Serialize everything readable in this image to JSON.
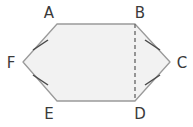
{
  "figure": {
    "name": "hexagon-with-diagonal",
    "shape_type": "hexagon",
    "background_color": "#ffffff",
    "fill_color": "#f2f2f2",
    "stroke_color": "#9a9a9a",
    "tick_color": "#4a4a4a",
    "dash_color": "#6e6e6e",
    "label_color": "#3a3a3a",
    "vertices": [
      {
        "id": "A",
        "label": "A",
        "x": 57,
        "y": 24,
        "label_x": 49,
        "label_y": 18
      },
      {
        "id": "B",
        "label": "B",
        "x": 135,
        "y": 24,
        "label_x": 137,
        "label_y": 18
      },
      {
        "id": "C",
        "label": "C",
        "x": 170,
        "y": 62,
        "label_x": 178,
        "label_y": 67
      },
      {
        "id": "D",
        "label": "D",
        "x": 135,
        "y": 101,
        "label_x": 137,
        "label_y": 119
      },
      {
        "id": "E",
        "label": "E",
        "x": 57,
        "y": 101,
        "label_x": 49,
        "label_y": 119
      },
      {
        "id": "F",
        "label": "F",
        "x": 23,
        "y": 62,
        "label_x": 7,
        "label_y": 67
      }
    ],
    "outline_points": "57,24 135,24 170,62 135,101 57,101 23,62",
    "diagonal": {
      "name": "segment-BD",
      "from": "B",
      "to": "D",
      "style": "dashed",
      "x1": 135,
      "y1": 24,
      "x2": 135,
      "y2": 101
    },
    "tick_marks": [
      {
        "name": "tick-FA",
        "on_edge": "FA",
        "x1": 33,
        "y1": 50,
        "x2": 48,
        "y2": 40
      },
      {
        "name": "tick-BC",
        "on_edge": "BC",
        "x1": 145,
        "y1": 40,
        "x2": 160,
        "y2": 50
      },
      {
        "name": "tick-EF",
        "on_edge": "EF",
        "x1": 33,
        "y1": 75,
        "x2": 48,
        "y2": 85
      },
      {
        "name": "tick-CD",
        "on_edge": "CD",
        "x1": 145,
        "y1": 85,
        "x2": 160,
        "y2": 75
      }
    ],
    "edges": [
      {
        "name": "edge-AB",
        "from": "A",
        "to": "B"
      },
      {
        "name": "edge-BC",
        "from": "B",
        "to": "C"
      },
      {
        "name": "edge-CD",
        "from": "C",
        "to": "D"
      },
      {
        "name": "edge-DE",
        "from": "D",
        "to": "E"
      },
      {
        "name": "edge-EF",
        "from": "E",
        "to": "F"
      },
      {
        "name": "edge-FA",
        "from": "F",
        "to": "A"
      }
    ]
  }
}
